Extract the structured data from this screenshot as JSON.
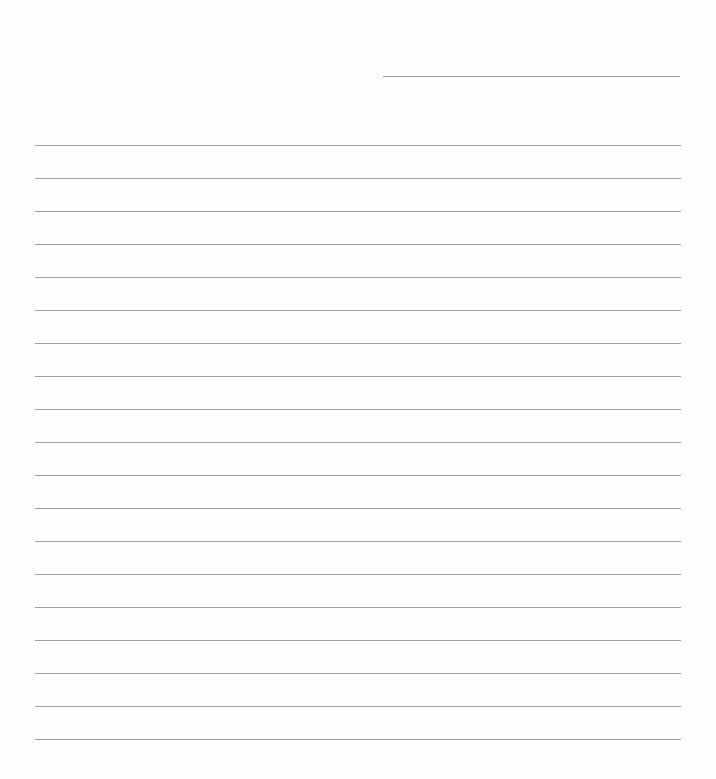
{
  "page": {
    "type": "lined-paper",
    "background_color": "#fefefe",
    "line_color": "#a0a0a0"
  },
  "header_line": {
    "value": ""
  },
  "rules": {
    "count": 19,
    "first_y": 145,
    "spacing": 33,
    "values": [
      "",
      "",
      "",
      "",
      "",
      "",
      "",
      "",
      "",
      "",
      "",
      "",
      "",
      "",
      "",
      "",
      "",
      "",
      ""
    ]
  }
}
